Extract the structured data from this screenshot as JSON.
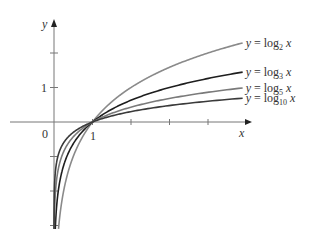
{
  "chart_data": {
    "type": "line",
    "title": "",
    "xlabel": "x",
    "ylabel": "y",
    "origin_label": "0",
    "x_tick_labels": [
      "1"
    ],
    "y_tick_labels": [
      "1"
    ],
    "xlim": [
      0,
      5
    ],
    "ylim": [
      -3,
      3
    ],
    "grid": false,
    "legend_position": "right, inline labels at curve ends",
    "series": [
      {
        "name": "y = log2 x",
        "base": 2,
        "label_main": "y = log",
        "label_sub": "2",
        "label_var": "x",
        "color": "#8a8a8a",
        "x_end": 4.9,
        "y_end": 2.29
      },
      {
        "name": "y = log3 x",
        "base": 3,
        "label_main": "y = log",
        "label_sub": "3",
        "label_var": "x",
        "color": "#1e1e1e",
        "x_end": 4.9,
        "y_end": 1.45
      },
      {
        "name": "y = log5 x",
        "base": 5,
        "label_main": "y = log",
        "label_sub": "5",
        "label_var": "x",
        "color": "#7a7a7a",
        "x_end": 4.9,
        "y_end": 0.99
      },
      {
        "name": "y = log10 x",
        "base": 10,
        "label_main": "y = log",
        "label_sub": "10",
        "label_var": "x",
        "color": "#3a3a3a",
        "x_end": 4.9,
        "y_end": 0.69
      }
    ],
    "annotations": [
      "All curves pass through (1, 0)"
    ]
  }
}
